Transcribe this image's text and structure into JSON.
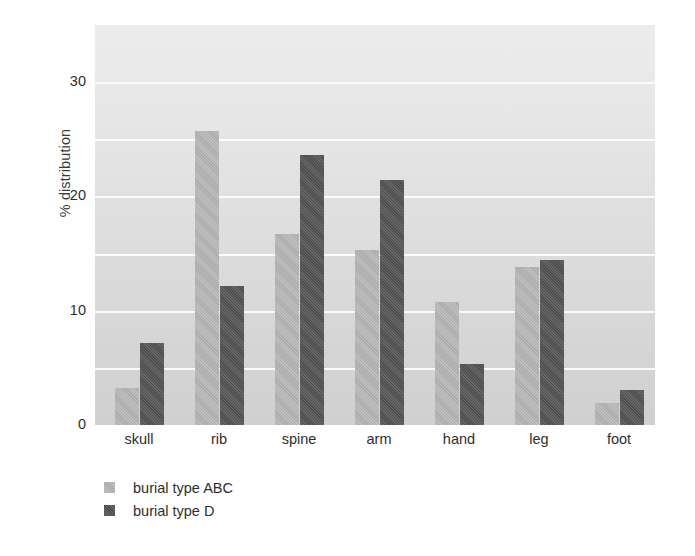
{
  "chart_data": {
    "type": "bar",
    "title": "",
    "subtitle": "",
    "xlabel": "",
    "ylabel": "% distribution",
    "categories": [
      "skull",
      "rib",
      "spine",
      "arm",
      "hand",
      "leg",
      "foot"
    ],
    "series": [
      {
        "name": "burial type ABC",
        "color": "#b4b4b4",
        "values": [
          3.2,
          25.7,
          16.7,
          15.3,
          10.8,
          13.8,
          1.9
        ]
      },
      {
        "name": "burial type D",
        "color": "#565656",
        "values": [
          7.2,
          12.2,
          23.6,
          21.4,
          5.3,
          14.4,
          3.1
        ]
      }
    ],
    "ylim": [
      0,
      35
    ],
    "ytick_labels": [
      "0",
      "10",
      "20",
      "30"
    ],
    "ytick_values": [
      0,
      10,
      20,
      30
    ],
    "gridline_values": [
      5,
      10,
      15,
      20,
      25,
      30
    ],
    "grid": true,
    "grid_color": "#fbfbfb",
    "grid_axis": "y",
    "legend_position": "below-left",
    "legend_entries": [
      "burial type ABC",
      "burial type D"
    ],
    "plot_background": "#e2e2e2",
    "figure_background": "#ffffff"
  },
  "axes": {
    "y_title": "% distribution",
    "y_ticks": [
      {
        "label": "30",
        "value": 30
      },
      {
        "label": "20",
        "value": 20
      },
      {
        "label": "10",
        "value": 10
      },
      {
        "label": "0",
        "value": 0
      }
    ],
    "x_ticks": [
      {
        "label": "skull"
      },
      {
        "label": "rib"
      },
      {
        "label": "spine"
      },
      {
        "label": "arm"
      },
      {
        "label": "hand"
      },
      {
        "label": "leg"
      },
      {
        "label": "foot"
      }
    ]
  },
  "legend": {
    "items": [
      {
        "label": "burial type ABC",
        "series": "series-abc"
      },
      {
        "label": "burial type D",
        "series": "series-d"
      }
    ]
  }
}
